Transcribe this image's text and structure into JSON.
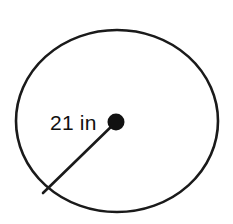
{
  "figure": {
    "type": "geometry-diagram",
    "shape": "circle",
    "background_color": "#ffffff",
    "stroke_color": "#1a1a1a",
    "label": {
      "text": "21 in",
      "measurement_value": "21",
      "measurement_unit": "in",
      "describes": "radius",
      "x": 50,
      "y": 130
    },
    "circle": {
      "center_x": 117,
      "center_y": 121,
      "radius_x": 101,
      "radius_y": 91,
      "stroke_width": 2.6
    },
    "center_point": {
      "name": "center-dot",
      "x": 116,
      "y": 122,
      "radius": 8.5,
      "fill": "#111111"
    },
    "radius_segment": {
      "name": "radius-line",
      "from_x": 116,
      "from_y": 122,
      "to_x": 43,
      "to_y": 193,
      "stroke_width": 2.6
    }
  }
}
